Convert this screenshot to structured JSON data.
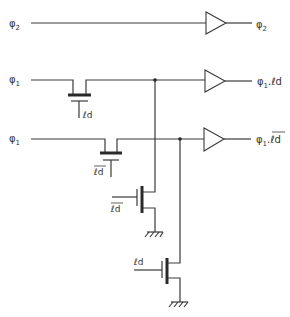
{
  "diagram": {
    "type": "circuit-schematic",
    "inputs": [
      {
        "id": "in_phi2",
        "label": "φ",
        "sub": "2"
      },
      {
        "id": "in_phi1_a",
        "label": "φ",
        "sub": "1"
      },
      {
        "id": "in_phi1_b",
        "label": "φ",
        "sub": "1"
      }
    ],
    "outputs": [
      {
        "id": "out_phi2",
        "label": "φ",
        "sub": "2",
        "suffix": ""
      },
      {
        "id": "out_phi1_ld",
        "label": "φ",
        "sub": "1",
        "suffix": ".ℓd"
      },
      {
        "id": "out_phi1_ldbar",
        "label": "φ",
        "sub": "1",
        "suffix": ".",
        "overbar_suffix": "ℓd"
      }
    ],
    "gate_labels": {
      "pass1": "ℓd",
      "pass2_overbar": "ℓd",
      "pulldown1_overbar": "ℓd",
      "pulldown2": "ℓd"
    },
    "components": [
      {
        "name": "buffer-phi2",
        "type": "buffer"
      },
      {
        "name": "buffer-phi1-ld",
        "type": "buffer"
      },
      {
        "name": "buffer-phi1-ldbar",
        "type": "buffer"
      },
      {
        "name": "pass-transistor-1",
        "type": "transistor",
        "gate": "ℓd"
      },
      {
        "name": "pass-transistor-2",
        "type": "transistor",
        "gate": "ℓd̄"
      },
      {
        "name": "pulldown-transistor-1",
        "type": "transistor",
        "gate": "ℓd̄"
      },
      {
        "name": "pulldown-transistor-2",
        "type": "transistor",
        "gate": "ℓd"
      }
    ],
    "colors": {
      "line": "#3a3a3a",
      "background": "#ffffff",
      "text": "#333333"
    }
  }
}
